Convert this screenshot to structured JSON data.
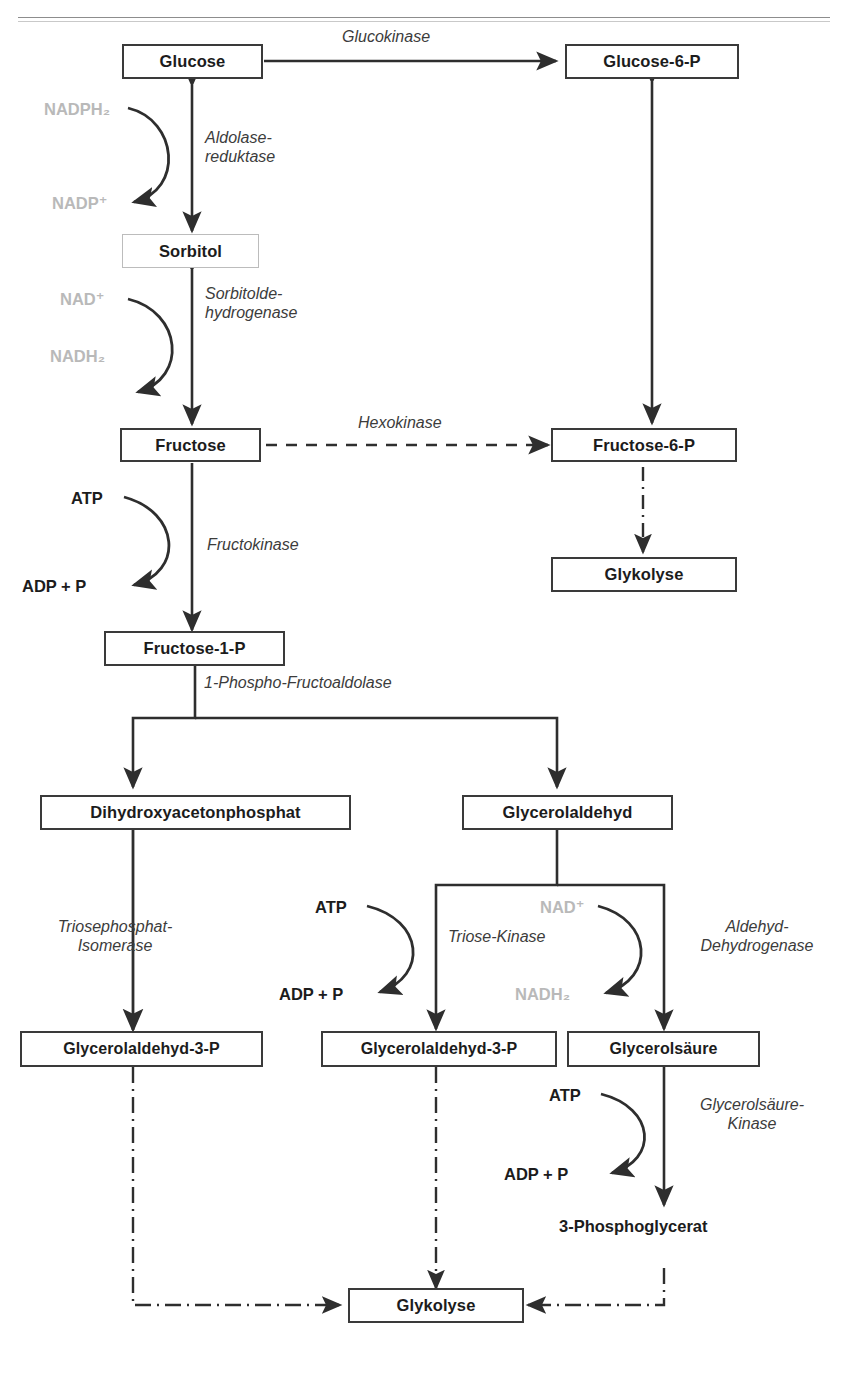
{
  "page": {
    "width": 849,
    "height": 1380,
    "background": "#ffffff",
    "ink": "#1c1c1c",
    "muted_ink": "#b9b9b9",
    "enzyme_ink": "#3c3c3c"
  },
  "nodes": {
    "glucose": "Glucose",
    "glucose6p": "Glucose-6-P",
    "sorbitol": "Sorbitol",
    "fructose": "Fructose",
    "fructose6p": "Fructose-6-P",
    "glykolyse_right": "Glykolyse",
    "fructose1p": "Fructose-1-P",
    "dhap": "Dihydroxyacetonphosphat",
    "glycerolaldehyd": "Glycerolaldehyd",
    "ga3p_left": "Glycerolaldehyd-3-P",
    "ga3p_mid": "Glycerolaldehyd-3-P",
    "glycerolsaeure": "Glycerolsäure",
    "phosphoglycerat": "3-Phosphoglycerat",
    "glykolyse_bottom": "Glykolyse"
  },
  "enzymes": {
    "glucokinase": "Glucokinase",
    "aldolase_reduktase": "Aldolase-\nreduktase",
    "sorbitoldehydrogenase": "Sorbitolde-\nhydrogenase",
    "hexokinase": "Hexokinase",
    "fructokinase": "Fructokinase",
    "phospho_fructoaldolase": "1-Phospho-Fructoaldolase",
    "triosephosphat_isomerase": "Triosephosphat-\nIsomerase",
    "triose_kinase": "Triose-Kinase",
    "aldehyd_dehydrogenase": "Aldehyd-\nDehydrogenase",
    "glycerolsaeure_kinase": "Glycerolsäure-\nKinase"
  },
  "cofactors": {
    "nadph2": "NADPH₂",
    "nadp_plus": "NADP⁺",
    "nad_plus_sorbitol": "NAD⁺",
    "nadh2_sorbitol": "NADH₂",
    "atp_fructokinase": "ATP",
    "adp_p_fructokinase": "ADP + P",
    "atp_triose": "ATP",
    "adp_p_triose": "ADP + P",
    "nad_plus_aldehyd": "NAD⁺",
    "nadh2_aldehyd": "NADH₂",
    "atp_glycerolsaeure": "ATP",
    "adp_p_glycerolsaeure": "ADP + P"
  },
  "edge_styles": {
    "solid": "solid arrow",
    "double": "double-headed solid arrow",
    "dashed": "dashed arrow",
    "dashdot": "dash-dot arrow"
  }
}
